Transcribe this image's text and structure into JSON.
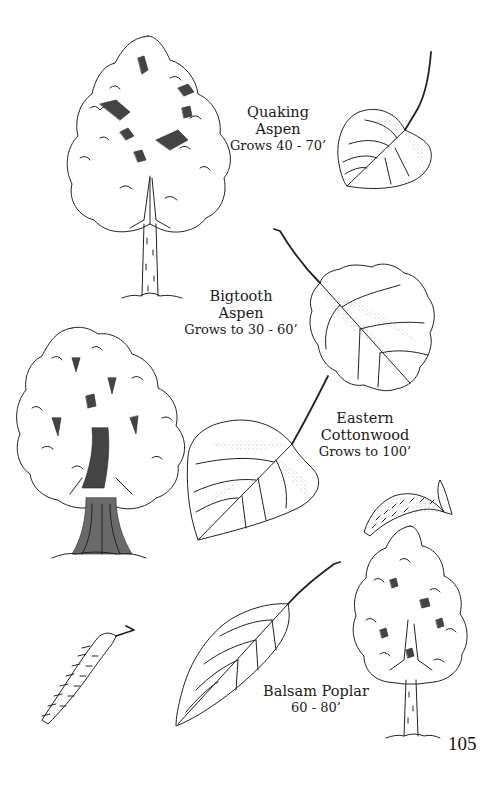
{
  "page": {
    "number": "105",
    "background": "#ffffff",
    "ink_color": "#1a1a1a"
  },
  "species": [
    {
      "name_line1": "Quaking",
      "name_line2": "Aspen",
      "height": "Grows 40 - 70’",
      "illustrations": [
        "tree",
        "leaf"
      ]
    },
    {
      "name_line1": "Bigtooth",
      "name_line2": "Aspen",
      "height": "Grows to 30 - 60’",
      "illustrations": [
        "leaf"
      ]
    },
    {
      "name_line1": "Eastern",
      "name_line2": "Cottonwood",
      "height": "Grows to 100’",
      "illustrations": [
        "tree",
        "leaf",
        "catkin"
      ]
    },
    {
      "name_line1": "Balsam Poplar",
      "name_line2": "",
      "height": "60 - 80’",
      "illustrations": [
        "tree",
        "leaf",
        "catkin"
      ]
    }
  ],
  "icons": {
    "quaking_aspen_tree": "tree-illustration",
    "quaking_aspen_leaf": "leaf-illustration",
    "bigtooth_aspen_leaf": "leaf-illustration",
    "cottonwood_tree": "tree-illustration",
    "cottonwood_leaf": "leaf-illustration",
    "cottonwood_catkin": "catkin-illustration",
    "balsam_poplar_tree": "tree-illustration",
    "balsam_poplar_leaf": "leaf-illustration",
    "balsam_poplar_catkin": "catkin-illustration"
  }
}
